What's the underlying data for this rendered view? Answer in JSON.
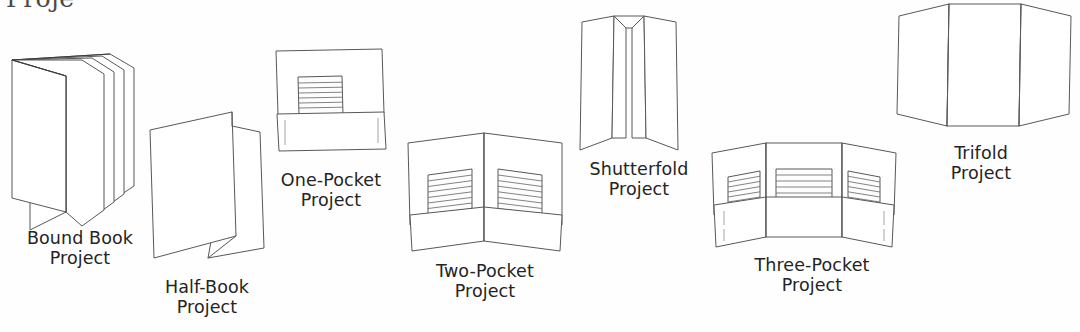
{
  "page": {
    "background_color": "#ffffff",
    "ink_color": "#58585a",
    "text_color": "#242424",
    "cropped_heading_fragment": "Proje"
  },
  "figures": [
    {
      "id": "bound-book",
      "icon": "bound-book-illustration",
      "caption_line1": "Bound Book",
      "caption_line2": "Project",
      "x": 6,
      "y": 52,
      "width": 132,
      "height": 182,
      "caption_x": 0,
      "caption_y": 228,
      "caption_width": 160
    },
    {
      "id": "half-book",
      "icon": "half-book-illustration",
      "caption_line1": "Half-Book",
      "caption_line2": "Project",
      "x": 146,
      "y": 108,
      "width": 120,
      "height": 160,
      "caption_x": 143,
      "caption_y": 277,
      "caption_width": 128
    },
    {
      "id": "one-pocket",
      "icon": "one-pocket-illustration",
      "caption_line1": "One-Pocket",
      "caption_line2": "Project",
      "x": 272,
      "y": 47,
      "width": 116,
      "height": 105,
      "caption_x": 263,
      "caption_y": 170,
      "caption_width": 136
    },
    {
      "id": "two-pocket",
      "icon": "two-pocket-illustration",
      "caption_line1": "Two-Pocket",
      "caption_line2": "Project",
      "x": 406,
      "y": 131,
      "width": 158,
      "height": 120,
      "caption_x": 414,
      "caption_y": 261,
      "caption_width": 142
    },
    {
      "id": "shutterfold",
      "icon": "shutterfold-illustration",
      "caption_line1": "Shutterfold",
      "caption_line2": "Project",
      "x": 578,
      "y": 12,
      "width": 100,
      "height": 140,
      "caption_x": 572,
      "caption_y": 159,
      "caption_width": 134
    },
    {
      "id": "three-pocket",
      "icon": "three-pocket-illustration",
      "caption_line1": "Three-Pocket",
      "caption_line2": "Project",
      "x": 708,
      "y": 141,
      "width": 190,
      "height": 110,
      "caption_x": 732,
      "caption_y": 255,
      "caption_width": 160
    },
    {
      "id": "trifold",
      "icon": "trifold-illustration",
      "caption_line1": "Trifold",
      "caption_line2": "Project",
      "x": 893,
      "y": 2,
      "width": 180,
      "height": 135,
      "caption_x": 926,
      "caption_y": 143,
      "caption_width": 110
    }
  ]
}
